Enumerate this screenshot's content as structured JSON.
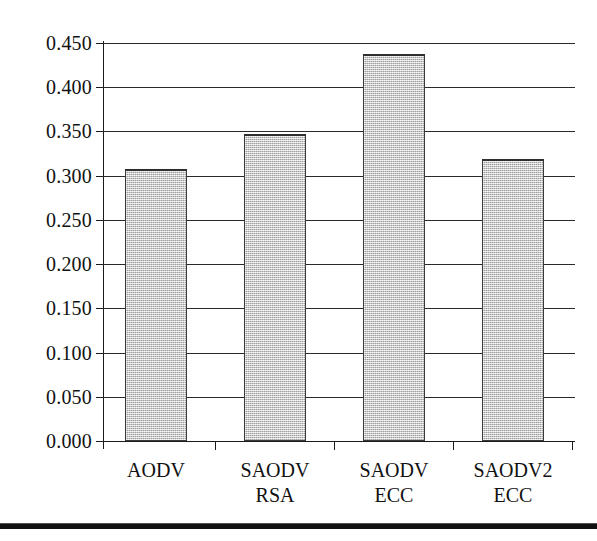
{
  "chart_data": {
    "type": "bar",
    "title": "",
    "subtitle": "",
    "xlabel": "",
    "ylabel": "",
    "categories": [
      "AODV",
      "SAODV\nRSA",
      "SAODV\nECC",
      "SAODV2\nECC"
    ],
    "category_lines": [
      [
        "AODV"
      ],
      [
        "SAODV",
        "RSA"
      ],
      [
        "SAODV",
        "ECC"
      ],
      [
        "SAODV2",
        "ECC"
      ]
    ],
    "values": [
      0.308,
      0.347,
      0.438,
      0.319
    ],
    "ylim": [
      0.0,
      0.45
    ],
    "ytick_values": [
      0.0,
      0.05,
      0.1,
      0.15,
      0.2,
      0.25,
      0.3,
      0.35,
      0.4,
      0.45
    ],
    "ytick_labels": [
      "0.000",
      "0.050",
      "0.100",
      "0.150",
      "0.200",
      "0.250",
      "0.300",
      "0.350",
      "0.400",
      "0.450"
    ],
    "ytick_step": 0.05,
    "grid": true,
    "grid_axis": "y",
    "legend": false,
    "legend_position": "none",
    "bar_fill_color": "#cdcdcd",
    "bar_edge_color": "#3a3a3a",
    "axis_color": "#1b1b1b",
    "grid_color": "#2a2a2a",
    "background_color": "#ffffff",
    "annotations": []
  },
  "figure": {
    "page_rule": "horizontal-rule"
  }
}
